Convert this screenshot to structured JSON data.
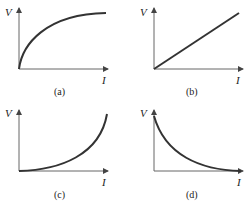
{
  "figure": {
    "panels": [
      {
        "id": "a",
        "caption": "(a)",
        "y_label": "V",
        "x_label": "I",
        "shape": "concave increasing (saturating)"
      },
      {
        "id": "b",
        "caption": "(b)",
        "y_label": "V",
        "x_label": "I",
        "shape": "linear increasing through origin"
      },
      {
        "id": "c",
        "caption": "(c)",
        "y_label": "V",
        "x_label": "I",
        "shape": "convex increasing (exponential growth)"
      },
      {
        "id": "d",
        "caption": "(d)",
        "y_label": "V",
        "x_label": "I",
        "shape": "convex decreasing (exponential decay)"
      }
    ]
  },
  "colors": {
    "curve": "#333333",
    "axis": "#666666",
    "background": "#ffffff"
  }
}
